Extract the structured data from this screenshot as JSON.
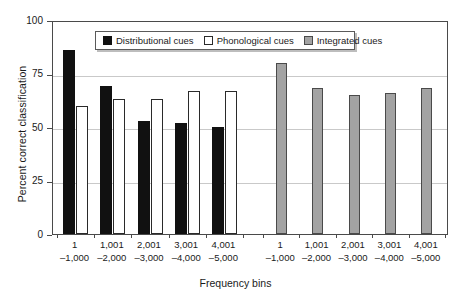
{
  "chart_data": {
    "type": "bar",
    "title": "",
    "xlabel": "Frequency bins",
    "ylabel": "Percent correct classification",
    "ylim": [
      0,
      100
    ],
    "yticks": [
      0,
      25,
      50,
      75,
      100
    ],
    "ytick_labels": [
      "0",
      "25",
      "50",
      "75",
      "100"
    ],
    "grid": true,
    "legend_position": "top-center",
    "categories": [
      "1–1,000",
      "1,001–2,000",
      "2,001–3,000",
      "3,001–4,000",
      "4,001–5,000"
    ],
    "category_lines": [
      {
        "line1": "1",
        "line2": "–1,000"
      },
      {
        "line1": "1,001",
        "line2": "–2,000"
      },
      {
        "line1": "2,001",
        "line2": "–3,000"
      },
      {
        "line1": "3,001",
        "line2": "–4,000"
      },
      {
        "line1": "4,001",
        "line2": "–5,000"
      }
    ],
    "series": [
      {
        "name": "Distributional cues",
        "color": "#111111",
        "group": "left",
        "values": [
          86,
          69,
          53,
          52,
          50
        ]
      },
      {
        "name": "Phonological cues",
        "color": "#ffffff",
        "group": "left",
        "values": [
          60,
          63,
          63,
          67,
          67
        ]
      },
      {
        "name": "Integrated cues",
        "color": "#a3a3a3",
        "group": "right",
        "values": [
          80,
          68,
          65,
          66,
          68
        ]
      }
    ],
    "panels": [
      {
        "id": "left",
        "series_names": [
          "Distributional cues",
          "Phonological cues"
        ]
      },
      {
        "id": "right",
        "series_names": [
          "Integrated cues"
        ]
      }
    ]
  },
  "legend": {
    "items": [
      {
        "label": "Distributional cues",
        "swatch": "dark"
      },
      {
        "label": "Phonological cues",
        "swatch": "white"
      },
      {
        "label": "Integrated cues",
        "swatch": "grey"
      }
    ]
  },
  "axes": {
    "y_title": "Percent correct classification",
    "x_title": "Frequency bins"
  },
  "colors": {
    "distributional": "#111111",
    "phonological": "#ffffff",
    "integrated": "#a3a3a3",
    "frame": "#4a4a4a",
    "grid": "#c9c9c9"
  }
}
